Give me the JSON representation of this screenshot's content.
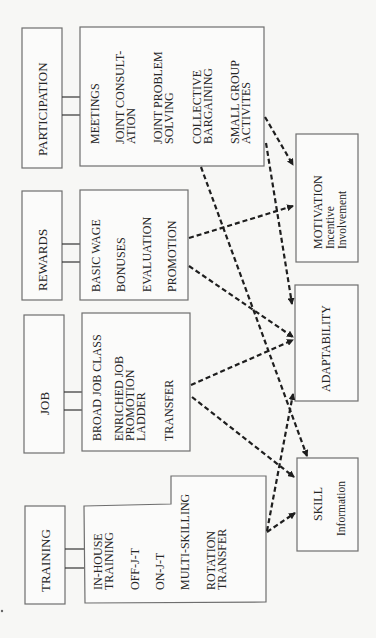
{
  "categories": [
    {
      "label": "PARTICIPATION",
      "items": [
        [
          "MEETINGS"
        ],
        [
          "JOINT CONSULT-",
          "ATION"
        ],
        [
          "JOINT PROBLEM",
          "SOLVING"
        ],
        [
          "COLLECTIVE",
          "BARGAINING"
        ],
        [
          "SMALL GROUP",
          "ACTIVITES"
        ]
      ]
    },
    {
      "label": "REWARDS",
      "items": [
        [
          "BASIC WAGE"
        ],
        [
          "BONUSES"
        ],
        [
          "EVALUATION"
        ],
        [
          "PROMOTION"
        ]
      ]
    },
    {
      "label": "JOB",
      "items": [
        [
          "BROAD JOB CLASS"
        ],
        [
          "ENRICHED JOB",
          "PROMOTION",
          "LADDER"
        ],
        [
          "TRANSFER"
        ]
      ]
    },
    {
      "label": "TRAINING",
      "items": [
        [
          "IN-HOUSE",
          "TRAINING"
        ],
        [
          "OFF-J-T"
        ],
        [
          "ON-J-T"
        ],
        [
          "MULTI-SKILLING"
        ],
        [
          "ROTATION",
          "TRANSFER"
        ]
      ]
    }
  ],
  "outcomes": [
    {
      "label": "MOTIVATION",
      "sub": [
        "Incentive",
        "Involvement"
      ]
    },
    {
      "label": "ADAPTABILITY",
      "sub": []
    },
    {
      "label": "SKILL",
      "sub": [
        "Information"
      ]
    }
  ],
  "arrows": [
    {
      "from": "PARTICIPATION",
      "to": "MOTIVATION"
    },
    {
      "from": "PARTICIPATION",
      "to": "ADAPTABILITY"
    },
    {
      "from": "PARTICIPATION",
      "to": "SKILL"
    },
    {
      "from": "REWARDS",
      "to": "MOTIVATION"
    },
    {
      "from": "REWARDS",
      "to": "ADAPTABILITY"
    },
    {
      "from": "JOB",
      "to": "ADAPTABILITY"
    },
    {
      "from": "JOB",
      "to": "SKILL"
    },
    {
      "from": "TRAINING",
      "to": "ADAPTABILITY"
    },
    {
      "from": "TRAINING",
      "to": "SKILL"
    }
  ]
}
